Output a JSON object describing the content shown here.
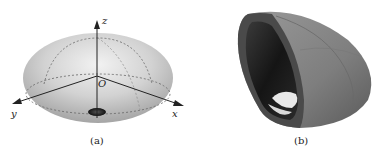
{
  "figure": {
    "panels": [
      {
        "id": "a",
        "caption": "(a)",
        "description": "Oblate ellipsoid with coordinate axes",
        "axes": {
          "z": "z",
          "x": "x",
          "y": "y",
          "origin": "O"
        }
      },
      {
        "id": "b",
        "caption": "(b)",
        "description": "Cut-away shell of ellipsoid showing inner cavity"
      }
    ],
    "colors": {
      "ellipsoid_light": "#e4e4e4",
      "ellipsoid_dark": "#a9a9a9",
      "shell_outer": "#8a8a8a",
      "shell_inner": "#1c1c1c",
      "axis": "#222222"
    }
  }
}
